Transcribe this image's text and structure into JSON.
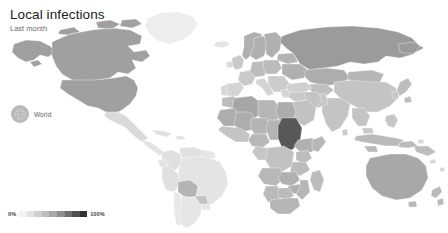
{
  "header": {
    "title": "Local infections",
    "subtitle": "Last month"
  },
  "selector": {
    "label": "World",
    "icon": "globe-icon",
    "bubble_color": "#b9b9b9"
  },
  "legend": {
    "min_label": "0%",
    "max_label": "100%",
    "stops": [
      "#f2f2f2",
      "#e2e2e2",
      "#cfcfcf",
      "#bdbdbd",
      "#a8a8a8",
      "#8f8f8f",
      "#6f6f6f",
      "#505050",
      "#323232"
    ]
  },
  "colors": {
    "background": "#ffffff",
    "no_data": "#f4f4f4",
    "graticule": "#f0f0f0",
    "border": "#ffffff",
    "title": "#1b1b1b",
    "subtitle": "#6b6b6b"
  },
  "chart_data": {
    "type": "heatmap",
    "title": "Local infections",
    "subtitle": "Last month",
    "xlabel": "",
    "ylabel": "",
    "unit": "%",
    "value_range": [
      0,
      100
    ],
    "legend": {
      "position": "bottom-left",
      "min": "0%",
      "max": "100%"
    },
    "grid": false,
    "regions": [
      {
        "name": "Canada",
        "value": 72
      },
      {
        "name": "United States",
        "value": 72
      },
      {
        "name": "Greenland",
        "value": 8
      },
      {
        "name": "Alaska",
        "value": 72
      },
      {
        "name": "Mexico",
        "value": 30
      },
      {
        "name": "Guatemala",
        "value": 22
      },
      {
        "name": "Honduras",
        "value": 22
      },
      {
        "name": "Nicaragua",
        "value": 18
      },
      {
        "name": "Costa Rica",
        "value": 18
      },
      {
        "name": "Panama",
        "value": 18
      },
      {
        "name": "Cuba",
        "value": 20
      },
      {
        "name": "Colombia",
        "value": 20
      },
      {
        "name": "Venezuela",
        "value": 20
      },
      {
        "name": "Brazil",
        "value": 18
      },
      {
        "name": "Peru",
        "value": 20
      },
      {
        "name": "Bolivia",
        "value": 45
      },
      {
        "name": "Paraguay",
        "value": 40
      },
      {
        "name": "Argentina",
        "value": 16
      },
      {
        "name": "Chile",
        "value": 16
      },
      {
        "name": "Uruguay",
        "value": 16
      },
      {
        "name": "United Kingdom",
        "value": 30
      },
      {
        "name": "Ireland",
        "value": 20
      },
      {
        "name": "France",
        "value": 30
      },
      {
        "name": "Spain",
        "value": 25
      },
      {
        "name": "Portugal",
        "value": 25
      },
      {
        "name": "Germany",
        "value": 35
      },
      {
        "name": "Poland",
        "value": 35
      },
      {
        "name": "Norway",
        "value": 45
      },
      {
        "name": "Sweden",
        "value": 45
      },
      {
        "name": "Finland",
        "value": 45
      },
      {
        "name": "Italy",
        "value": 25
      },
      {
        "name": "Greece",
        "value": 25
      },
      {
        "name": "Turkey",
        "value": 25
      },
      {
        "name": "Ukraine",
        "value": 45
      },
      {
        "name": "Russia",
        "value": 58
      },
      {
        "name": "Kazakhstan",
        "value": 48
      },
      {
        "name": "China",
        "value": 30
      },
      {
        "name": "Mongolia",
        "value": 40
      },
      {
        "name": "India",
        "value": 30
      },
      {
        "name": "Pakistan",
        "value": 28
      },
      {
        "name": "Iran",
        "value": 32
      },
      {
        "name": "Saudi Arabia",
        "value": 32
      },
      {
        "name": "Iraq",
        "value": 30
      },
      {
        "name": "Egypt",
        "value": 48
      },
      {
        "name": "Libya",
        "value": 40
      },
      {
        "name": "Algeria",
        "value": 55
      },
      {
        "name": "Morocco",
        "value": 40
      },
      {
        "name": "Mauritania",
        "value": 48
      },
      {
        "name": "Mali",
        "value": 48
      },
      {
        "name": "Niger",
        "value": 42
      },
      {
        "name": "Chad",
        "value": 42
      },
      {
        "name": "Sudan",
        "value": 92
      },
      {
        "name": "Ethiopia",
        "value": 45
      },
      {
        "name": "Somalia",
        "value": 40
      },
      {
        "name": "Kenya",
        "value": 35
      },
      {
        "name": "Tanzania",
        "value": 35
      },
      {
        "name": "DR Congo",
        "value": 32
      },
      {
        "name": "Angola",
        "value": 40
      },
      {
        "name": "Zambia",
        "value": 45
      },
      {
        "name": "Zimbabwe",
        "value": 45
      },
      {
        "name": "Namibia",
        "value": 38
      },
      {
        "name": "Botswana",
        "value": 38
      },
      {
        "name": "South Africa",
        "value": 40
      },
      {
        "name": "Madagascar",
        "value": 35
      },
      {
        "name": "Nigeria",
        "value": 38
      },
      {
        "name": "Indonesia",
        "value": 38
      },
      {
        "name": "Malaysia",
        "value": 30
      },
      {
        "name": "Philippines",
        "value": 30
      },
      {
        "name": "Papua New Guinea",
        "value": 35
      },
      {
        "name": "Australia",
        "value": 58
      },
      {
        "name": "New Zealand",
        "value": 40
      },
      {
        "name": "Japan",
        "value": 35
      },
      {
        "name": "South Korea",
        "value": 30
      }
    ]
  }
}
